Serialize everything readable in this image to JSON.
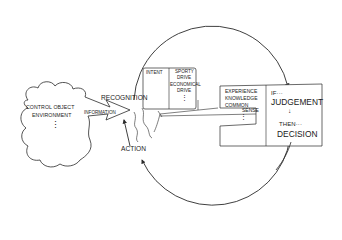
{
  "environment": {
    "line1": "CONTROL OBJECT",
    "line2": "ENVIRONMENT",
    "ellipsis": "⋮"
  },
  "flow": {
    "information": "INFORMATION",
    "recognition": "RECOGNITION",
    "action": "ACTION"
  },
  "intent_box": {
    "label": "INTENT",
    "options": [
      "SPORTY",
      "DRIVE",
      "ECONOMICAL",
      "DRIVE"
    ],
    "ellipsis": "⋮"
  },
  "knowledge_box": {
    "items": [
      "EXPERIENCE",
      "KNOWLEDGE",
      "COMMON",
      "SENSE"
    ],
    "ellipsis": "⋮"
  },
  "judgement_box": {
    "if_label": "IF···",
    "judgement": "JUDGEMENT",
    "arrow": "↓",
    "then_label": "THEN···",
    "decision": "DECISION"
  },
  "colors": {
    "stroke": "#2a2a2a",
    "background": "#ffffff"
  }
}
